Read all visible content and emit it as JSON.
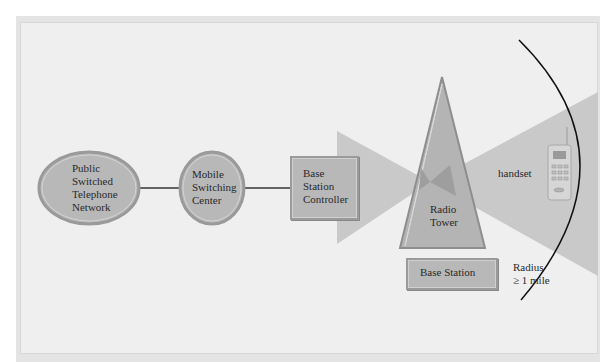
{
  "diagram": {
    "nodes": {
      "pstn": {
        "label": "Public\nSwitched\nTelephone\nNetwork",
        "shape": "ellipse"
      },
      "msc": {
        "label": "Mobile\nSwitching\nCenter",
        "shape": "circle"
      },
      "bsc": {
        "label": "Base\nStation\nController",
        "shape": "rectangle"
      },
      "radio_tower": {
        "label": "Radio\nTower",
        "shape": "triangle"
      },
      "base_station": {
        "label": "Base Station",
        "shape": "rectangle"
      },
      "handset": {
        "label": "handset",
        "icon": "mobile-phone-icon"
      }
    },
    "radius_label": "Radius\n≥ 1 mile",
    "edges": [
      {
        "from": "pstn",
        "to": "msc"
      },
      {
        "from": "msc",
        "to": "bsc"
      }
    ],
    "colors": {
      "background": "#efefef",
      "node_fill": "#b8b8b8",
      "node_border": "#9a9a9a",
      "beam": "#c9c9c9",
      "beam_overlap": "#9e9e9e",
      "line": "#333333"
    }
  }
}
